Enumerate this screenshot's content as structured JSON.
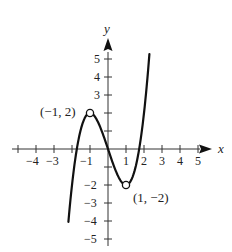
{
  "chart_data": {
    "type": "line",
    "title": "",
    "function": "f(x) = x^3 - 3x",
    "xlabel": "x",
    "ylabel": "y",
    "xlim": [
      -5,
      5
    ],
    "ylim": [
      -5,
      5
    ],
    "x_ticks": [
      -4,
      -3,
      -1,
      1,
      2,
      3,
      4,
      5
    ],
    "x_tick_labels": [
      "-4",
      "-3",
      "-1",
      "1",
      "2",
      "3",
      "4",
      "5"
    ],
    "y_ticks": [
      5,
      4,
      3,
      -2,
      -3,
      -4,
      -5
    ],
    "y_tick_labels": [
      "5",
      "4",
      "3",
      "-2",
      "-3",
      "-4",
      "-5"
    ],
    "grid": false,
    "legend": null,
    "series": [
      {
        "name": "curve",
        "x": [
          -2.2,
          -2,
          -1.5,
          -1,
          -0.5,
          0,
          0.5,
          1,
          1.5,
          2,
          2.3
        ],
        "y": [
          -4.05,
          -2,
          1.125,
          2,
          1.375,
          0,
          -1.375,
          -2,
          -1.125,
          2,
          5.27
        ]
      }
    ],
    "annotations": [
      {
        "label": "(−1, 2)",
        "x": -1,
        "y": 2,
        "marker": "open-circle"
      },
      {
        "label": "(1, −2)",
        "x": 1,
        "y": -2,
        "marker": "open-circle"
      }
    ]
  },
  "axes": {
    "x_label": "x",
    "y_label": "y"
  },
  "labels": {
    "max_point": "(−1, 2)",
    "min_point": "(1, −2)"
  },
  "ticks": {
    "x": [
      "−4",
      "−3",
      "−1",
      "1",
      "2",
      "3",
      "4",
      "5"
    ],
    "y": [
      "5",
      "4",
      "3",
      "−2",
      "−3",
      "−4",
      "−5"
    ]
  }
}
